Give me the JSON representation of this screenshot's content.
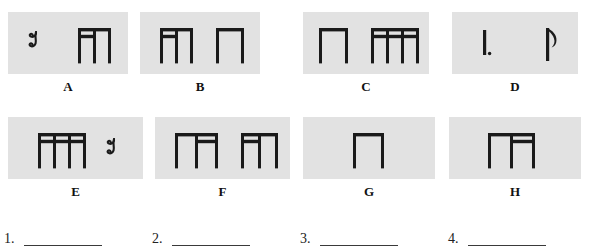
{
  "worksheet": {
    "title": "Rhythm Identification Worksheet",
    "background_color": "#ffffff",
    "box_fill_color": "#e2e2e2",
    "ink_color": "#1a1a1a"
  },
  "boxes": [
    {
      "label": "A",
      "x": 8,
      "y": 12,
      "width": 120,
      "height": 62,
      "figures": [
        {
          "type": "eighth-rest",
          "x": 18,
          "y": 18
        },
        {
          "type": "beamed-group",
          "x": 68,
          "y": 16,
          "stems": 3,
          "secondary_beam": "left-partial",
          "stem_spacing": 15
        }
      ]
    },
    {
      "label": "B",
      "x": 140,
      "y": 12,
      "width": 120,
      "height": 62,
      "figures": [
        {
          "type": "beamed-group",
          "x": 18,
          "y": 16,
          "stems": 3,
          "secondary_beam": "left-partial",
          "stem_spacing": 15
        },
        {
          "type": "beamed-group",
          "x": 74,
          "y": 16,
          "stems": 2,
          "secondary_beam": "none",
          "stem_spacing": 25
        }
      ]
    },
    {
      "label": "C",
      "x": 303,
      "y": 12,
      "width": 126,
      "height": 62,
      "figures": [
        {
          "type": "beamed-group",
          "x": 14,
          "y": 16,
          "stems": 2,
          "secondary_beam": "none",
          "stem_spacing": 26
        },
        {
          "type": "beamed-group",
          "x": 66,
          "y": 16,
          "stems": 4,
          "secondary_beam": "full",
          "stem_spacing": 15
        }
      ]
    },
    {
      "label": "D",
      "x": 452,
      "y": 12,
      "width": 126,
      "height": 62,
      "figures": [
        {
          "type": "dotted-stem",
          "x": 30,
          "y": 18
        },
        {
          "type": "flagged-eighth",
          "x": 92,
          "y": 16
        }
      ]
    },
    {
      "label": "E",
      "x": 8,
      "y": 117,
      "width": 135,
      "height": 62,
      "figures": [
        {
          "type": "beamed-group",
          "x": 28,
          "y": 16,
          "stems": 4,
          "secondary_beam": "full",
          "stem_spacing": 15
        },
        {
          "type": "eighth-rest",
          "x": 96,
          "y": 20
        }
      ]
    },
    {
      "label": "F",
      "x": 155,
      "y": 117,
      "width": 135,
      "height": 62,
      "figures": [
        {
          "type": "beamed-group",
          "x": 18,
          "y": 16,
          "stems": 3,
          "secondary_beam": "right-partial",
          "stem_spacing": 20
        },
        {
          "type": "beamed-group",
          "x": 84,
          "y": 16,
          "stems": 3,
          "secondary_beam": "left-partial",
          "stem_spacing": 17
        }
      ]
    },
    {
      "label": "G",
      "x": 303,
      "y": 117,
      "width": 132,
      "height": 62,
      "figures": [
        {
          "type": "beamed-group",
          "x": 48,
          "y": 16,
          "stems": 2,
          "secondary_beam": "none",
          "stem_spacing": 28
        }
      ]
    },
    {
      "label": "H",
      "x": 449,
      "y": 117,
      "width": 132,
      "height": 62,
      "figures": [
        {
          "type": "beamed-group",
          "x": 37,
          "y": 16,
          "stems": 3,
          "secondary_beam": "right-partial",
          "stem_spacing": 22
        }
      ]
    }
  ],
  "answers": [
    {
      "number": "1.",
      "x": 4,
      "value": ""
    },
    {
      "number": "2.",
      "x": 152,
      "value": ""
    },
    {
      "number": "3.",
      "x": 300,
      "value": ""
    },
    {
      "number": "4.",
      "x": 448,
      "value": ""
    }
  ]
}
